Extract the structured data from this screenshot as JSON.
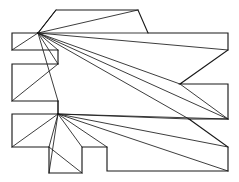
{
  "figure": {
    "name": "polygon-fan-triangulation",
    "title": "",
    "caption": "",
    "background_color": "#ffffff",
    "outline_color": "#1a1a1a",
    "diagonal_color": "#1a1a1a",
    "outline_width": 1.15,
    "diagonal_width": 0.85,
    "canvas": {
      "width": 239,
      "height": 182
    },
    "polygon": {
      "name": "rectilinear-polygon-boundary",
      "vertex_count": 26,
      "points": "56,10 138,10 148,33 228,33 228,50 180,84 228,84 228,119 189,119 228,147 228,171 107,171 107,147 82,147 82,173 49,173 49,147 12,147 12,114 58,114 58,101 12,101 12,64 58,64 58,50 12,50 12,33 38,33"
    },
    "apexes": [
      {
        "name": "upper-fan-apex",
        "x": 38,
        "y": 33
      },
      {
        "name": "lower-fan-apex",
        "x": 58,
        "y": 114
      }
    ],
    "diagonals": [
      {
        "name": "diagonal-1",
        "x1": 38,
        "y1": 33,
        "x2": 56,
        "y2": 10
      },
      {
        "name": "diagonal-2",
        "x1": 38,
        "y1": 33,
        "x2": 138,
        "y2": 10
      },
      {
        "name": "diagonal-3",
        "x1": 38,
        "y1": 33,
        "x2": 148,
        "y2": 33
      },
      {
        "name": "diagonal-4",
        "x1": 38,
        "y1": 33,
        "x2": 228,
        "y2": 50
      },
      {
        "name": "diagonal-5",
        "x1": 38,
        "y1": 33,
        "x2": 180,
        "y2": 84
      },
      {
        "name": "diagonal-6",
        "x1": 38,
        "y1": 33,
        "x2": 228,
        "y2": 119
      },
      {
        "name": "diagonal-7",
        "x1": 38,
        "y1": 33,
        "x2": 189,
        "y2": 119
      },
      {
        "name": "diagonal-8",
        "x1": 38,
        "y1": 33,
        "x2": 12,
        "y2": 50
      },
      {
        "name": "diagonal-9",
        "x1": 38,
        "y1": 33,
        "x2": 58,
        "y2": 50
      },
      {
        "name": "diagonal-10",
        "x1": 38,
        "y1": 33,
        "x2": 58,
        "y2": 64
      },
      {
        "name": "diagonal-11",
        "x1": 38,
        "y1": 33,
        "x2": 58,
        "y2": 101
      },
      {
        "name": "diagonal-12",
        "x1": 12,
        "y1": 101,
        "x2": 58,
        "y2": 64
      },
      {
        "name": "diagonal-13",
        "x1": 58,
        "y1": 114,
        "x2": 58,
        "y2": 101
      },
      {
        "name": "diagonal-14",
        "x1": 58,
        "y1": 114,
        "x2": 12,
        "y2": 147
      },
      {
        "name": "diagonal-15",
        "x1": 58,
        "y1": 114,
        "x2": 49,
        "y2": 147
      },
      {
        "name": "diagonal-16",
        "x1": 58,
        "y1": 114,
        "x2": 49,
        "y2": 173
      },
      {
        "name": "diagonal-17",
        "x1": 58,
        "y1": 114,
        "x2": 82,
        "y2": 147
      },
      {
        "name": "diagonal-18",
        "x1": 58,
        "y1": 114,
        "x2": 107,
        "y2": 147
      },
      {
        "name": "diagonal-19",
        "x1": 58,
        "y1": 114,
        "x2": 228,
        "y2": 147
      },
      {
        "name": "diagonal-20",
        "x1": 58,
        "y1": 114,
        "x2": 228,
        "y2": 171
      },
      {
        "name": "diagonal-21",
        "x1": 58,
        "y1": 114,
        "x2": 189,
        "y2": 119
      },
      {
        "name": "diagonal-22",
        "x1": 58,
        "y1": 114,
        "x2": 228,
        "y2": 119
      },
      {
        "name": "diagonal-23",
        "x1": 49,
        "y1": 147,
        "x2": 82,
        "y2": 173
      },
      {
        "name": "diagonal-24",
        "x1": 180,
        "y1": 84,
        "x2": 228,
        "y2": 119
      }
    ]
  }
}
